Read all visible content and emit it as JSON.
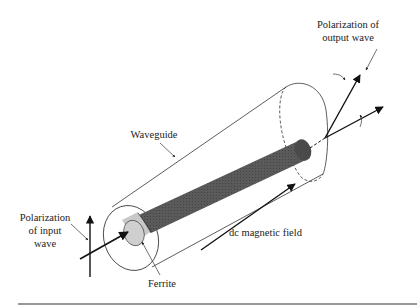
{
  "figure": {
    "labels": {
      "output_polarization_line1": "Polarization of",
      "output_polarization_line2": "output wave",
      "waveguide": "Waveguide",
      "input_polarization_line1": "Polarization",
      "input_polarization_line2": "of input",
      "input_polarization_line3": "wave",
      "dc_field": "dc magnetic field",
      "ferrite": "Ferrite"
    },
    "colors": {
      "ferrite_rod": "#555555",
      "ferrite_end": "#c8c8c8",
      "outline": "#222222",
      "bottom_rule": "#333333"
    }
  }
}
